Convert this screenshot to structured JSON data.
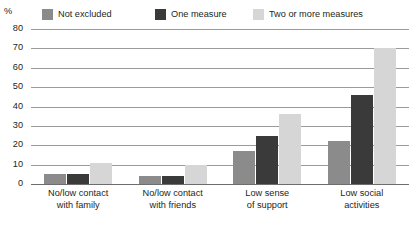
{
  "chart_data": {
    "type": "bar",
    "title": "",
    "xlabel": "",
    "ylabel": "%",
    "ylim": [
      0,
      80
    ],
    "yticks": [
      80,
      70,
      60,
      50,
      40,
      30,
      20,
      10,
      0
    ],
    "grid": true,
    "legend_position": "top",
    "categories": [
      "No/low contact with family",
      "No/low contact with friends",
      "Low sense of support",
      "Low social activities"
    ],
    "category_lines": [
      [
        "No/low contact",
        "with family"
      ],
      [
        "No/low contact",
        "with friends"
      ],
      [
        "Low sense",
        "of support"
      ],
      [
        "Low social",
        "activities"
      ]
    ],
    "series": [
      {
        "name": "Not excluded",
        "color": "#8b8b8b",
        "values": [
          5,
          4,
          17,
          22
        ]
      },
      {
        "name": "One measure",
        "color": "#3a3a3a",
        "values": [
          5,
          4,
          25,
          46
        ]
      },
      {
        "name": "Two or more measures",
        "color": "#d6d6d6",
        "values": [
          11,
          10,
          36,
          70
        ]
      }
    ]
  },
  "axis": {
    "unit": "%"
  },
  "colors": {
    "gridline": "#9b9b9b",
    "baseline": "#6d6d6d",
    "text": "#231f20",
    "background": "#ffffff"
  }
}
